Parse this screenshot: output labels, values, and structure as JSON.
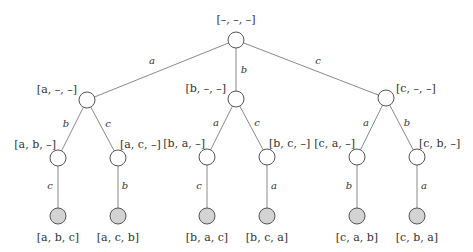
{
  "diagram": {
    "type": "tree",
    "title": "",
    "colors": {
      "edge": "#8a8a8a",
      "node_stroke": "#555555",
      "internal_fill": "#ffffff",
      "leaf_fill": "#d3d3d3"
    },
    "nodes": {
      "root": {
        "label": "[–, –, –]"
      },
      "a": {
        "label": "[a, –, –]"
      },
      "b": {
        "label": "[b, –, –]"
      },
      "c": {
        "label": "[c, –, –]"
      },
      "ab": {
        "label": "[a, b, –]"
      },
      "ac": {
        "label": "[a, c, –]"
      },
      "ba": {
        "label": "[b, a, –]"
      },
      "bc": {
        "label": "[b, c, –]"
      },
      "ca": {
        "label": "[c, a, –]"
      },
      "cb": {
        "label": "[c, b, –]"
      },
      "abc": {
        "label": "[a, b, c]"
      },
      "acb": {
        "label": "[a, c, b]"
      },
      "bac": {
        "label": "[b, a, c]"
      },
      "bca": {
        "label": "[b, c, a]"
      },
      "cab": {
        "label": "[c, a, b]"
      },
      "cba": {
        "label": "[c, b, a]"
      }
    },
    "edges": {
      "root_a": "a",
      "root_b": "b",
      "root_c": "c",
      "a_ab": "b",
      "a_ac": "c",
      "b_ba": "a",
      "b_bc": "c",
      "c_ca": "a",
      "c_cb": "b",
      "ab_abc": "c",
      "ac_acb": "b",
      "ba_bac": "c",
      "bc_bca": "a",
      "ca_cab": "b",
      "cb_cba": "a"
    }
  }
}
